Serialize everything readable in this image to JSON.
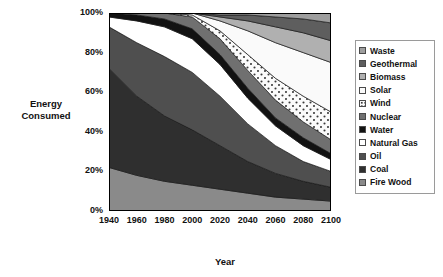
{
  "chart_data": {
    "type": "area",
    "title": "",
    "xlabel": "Year",
    "ylabel": "Energy Consumed",
    "stacked": true,
    "normalized": "100%",
    "grid": false,
    "legend_position": "right",
    "xlim": [
      1940,
      2100
    ],
    "ylim": [
      0,
      100
    ],
    "xticks": [
      "1940",
      "1960",
      "1980",
      "2000",
      "2020",
      "2040",
      "2060",
      "2080",
      "2100"
    ],
    "yticks": [
      "0%",
      "20%",
      "40%",
      "60%",
      "80%",
      "100%"
    ],
    "x": [
      1940,
      1960,
      1980,
      2000,
      2020,
      2040,
      2060,
      2080,
      2100
    ],
    "series": [
      {
        "name": "Fire Wood",
        "color": "#8a8a8a",
        "pattern": "solid",
        "values": [
          22,
          18,
          15,
          13,
          11,
          9,
          7,
          6,
          5
        ]
      },
      {
        "name": "Coal",
        "color": "#2f2f2f",
        "pattern": "solid",
        "values": [
          50,
          40,
          33,
          28,
          22,
          16,
          12,
          9,
          7
        ]
      },
      {
        "name": "Oil",
        "color": "#4f4f4f",
        "pattern": "solid",
        "values": [
          21,
          27,
          30,
          29,
          25,
          19,
          14,
          10,
          8
        ]
      },
      {
        "name": "Natural Gas",
        "color": "#ffffff",
        "pattern": "solid",
        "values": [
          5,
          11,
          15,
          17,
          16,
          13,
          10,
          8,
          6
        ]
      },
      {
        "name": "Water",
        "color": "#121212",
        "pattern": "solid",
        "values": [
          2,
          3,
          4,
          5,
          5,
          5,
          4,
          4,
          3
        ]
      },
      {
        "name": "Nuclear",
        "color": "#707070",
        "pattern": "solid",
        "values": [
          0,
          1,
          3,
          6,
          8,
          9,
          9,
          8,
          7
        ]
      },
      {
        "name": "Wind",
        "color": "#f2f2f2",
        "pattern": "dotted",
        "values": [
          0,
          0,
          0,
          1,
          4,
          8,
          11,
          13,
          14
        ]
      },
      {
        "name": "Solar",
        "color": "#fafafa",
        "pattern": "solid",
        "values": [
          0,
          0,
          0,
          1,
          5,
          12,
          18,
          22,
          25
        ]
      },
      {
        "name": "Biomass",
        "color": "#b0b0b0",
        "pattern": "solid",
        "values": [
          0,
          0,
          0,
          0,
          2,
          5,
          8,
          10,
          11
        ]
      },
      {
        "name": "Geothermal",
        "color": "#5e5e5e",
        "pattern": "solid",
        "values": [
          0,
          0,
          0,
          0,
          1,
          3,
          5,
          7,
          9
        ]
      },
      {
        "name": "Waste",
        "color": "#9e9e9e",
        "pattern": "solid",
        "values": [
          0,
          0,
          0,
          0,
          1,
          1,
          2,
          3,
          5
        ]
      }
    ]
  },
  "legend": {
    "items": [
      {
        "label": "Waste",
        "color": "#9e9e9e",
        "pattern": "solid"
      },
      {
        "label": "Geothermal",
        "color": "#5e5e5e",
        "pattern": "solid"
      },
      {
        "label": "Biomass",
        "color": "#b0b0b0",
        "pattern": "solid"
      },
      {
        "label": "Solar",
        "color": "#fafafa",
        "pattern": "solid"
      },
      {
        "label": "Wind",
        "color": "#f2f2f2",
        "pattern": "dotted"
      },
      {
        "label": "Nuclear",
        "color": "#707070",
        "pattern": "solid"
      },
      {
        "label": "Water",
        "color": "#121212",
        "pattern": "solid"
      },
      {
        "label": "Natural Gas",
        "color": "#ffffff",
        "pattern": "solid"
      },
      {
        "label": "Oil",
        "color": "#4f4f4f",
        "pattern": "solid"
      },
      {
        "label": "Coal",
        "color": "#2f2f2f",
        "pattern": "solid"
      },
      {
        "label": "Fire Wood",
        "color": "#8a8a8a",
        "pattern": "solid"
      }
    ]
  }
}
